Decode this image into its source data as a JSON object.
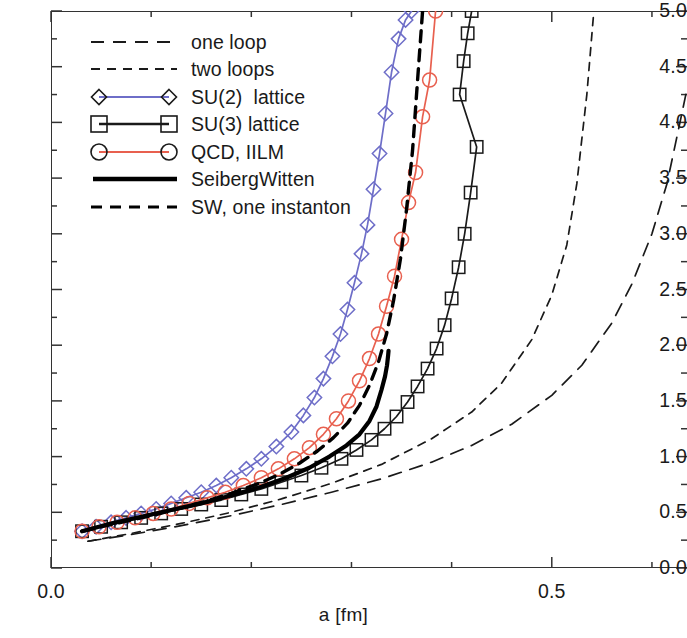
{
  "chart_data": {
    "type": "line",
    "title": "",
    "xlabel": "a [fm]",
    "ylabel": "",
    "xlim": [
      0.0,
      0.635
    ],
    "ylim": [
      0.0,
      5.0
    ],
    "grid": false,
    "legend_position": "upper-left",
    "y_ticks": [
      "0.0",
      "0.5",
      "1.0",
      "1.5",
      "2.0",
      "2.5",
      "3.0",
      "3.5",
      "4.0",
      "4.5",
      "5.0"
    ],
    "y_tick_values": [
      0.0,
      0.5,
      1.0,
      1.5,
      2.0,
      2.5,
      3.0,
      3.5,
      4.0,
      4.5,
      5.0
    ],
    "y_minor_step": 0.25,
    "x_ticks": [
      "0.0",
      "0.5"
    ],
    "x_tick_values": [
      0.0,
      0.5
    ],
    "x_minor_step": 0.1,
    "series": [
      {
        "name": "one loop",
        "style": "long-dash",
        "color": "#1a1a1a",
        "marker": "none",
        "x": [
          0.037,
          0.08,
          0.13,
          0.18,
          0.23,
          0.28,
          0.33,
          0.38,
          0.42,
          0.46,
          0.5,
          0.53,
          0.56,
          0.58,
          0.6,
          0.615,
          0.628,
          0.635
        ],
        "y": [
          0.24,
          0.3,
          0.38,
          0.47,
          0.57,
          0.68,
          0.8,
          0.95,
          1.1,
          1.29,
          1.55,
          1.82,
          2.2,
          2.55,
          3.0,
          3.45,
          4.0,
          4.3
        ]
      },
      {
        "name": "two loops",
        "style": "short-dash",
        "color": "#1a1a1a",
        "marker": "none",
        "x": [
          0.037,
          0.08,
          0.13,
          0.18,
          0.23,
          0.28,
          0.33,
          0.38,
          0.42,
          0.45,
          0.48,
          0.5,
          0.515,
          0.525,
          0.535,
          0.542
        ],
        "y": [
          0.24,
          0.31,
          0.4,
          0.5,
          0.62,
          0.76,
          0.93,
          1.16,
          1.4,
          1.66,
          2.05,
          2.45,
          2.9,
          3.45,
          4.25,
          5.0
        ]
      },
      {
        "name": "SU(2)  lattice",
        "style": "solid",
        "color": "#6e6ec8",
        "marker": "diamond",
        "x": [
          0.031,
          0.045,
          0.06,
          0.075,
          0.09,
          0.105,
          0.12,
          0.135,
          0.15,
          0.165,
          0.18,
          0.195,
          0.21,
          0.225,
          0.24,
          0.252,
          0.263,
          0.272,
          0.281,
          0.289,
          0.296,
          0.303,
          0.31,
          0.316,
          0.322,
          0.328,
          0.334,
          0.34,
          0.347,
          0.354,
          0.36
        ],
        "y": [
          0.33,
          0.37,
          0.41,
          0.45,
          0.49,
          0.53,
          0.58,
          0.63,
          0.68,
          0.74,
          0.81,
          0.89,
          0.98,
          1.09,
          1.22,
          1.37,
          1.53,
          1.7,
          1.9,
          2.1,
          2.32,
          2.56,
          2.82,
          3.08,
          3.4,
          3.72,
          4.08,
          4.45,
          4.75,
          4.92,
          5.0
        ]
      },
      {
        "name": "SU(3) lattice",
        "style": "solid",
        "color": "#1a1a1a",
        "marker": "square",
        "x": [
          0.031,
          0.05,
          0.07,
          0.09,
          0.11,
          0.13,
          0.15,
          0.17,
          0.19,
          0.21,
          0.23,
          0.25,
          0.27,
          0.29,
          0.305,
          0.32,
          0.333,
          0.345,
          0.356,
          0.366,
          0.376,
          0.385,
          0.393,
          0.4,
          0.407,
          0.413,
          0.419,
          0.425,
          0.408,
          0.412,
          0.416,
          0.42
        ],
        "y": [
          0.33,
          0.37,
          0.41,
          0.45,
          0.49,
          0.53,
          0.57,
          0.61,
          0.66,
          0.71,
          0.77,
          0.83,
          0.9,
          0.98,
          1.06,
          1.15,
          1.25,
          1.36,
          1.49,
          1.63,
          1.79,
          1.97,
          2.18,
          2.42,
          2.7,
          3.0,
          3.37,
          3.78,
          4.25,
          4.55,
          4.8,
          5.0
        ]
      },
      {
        "name": "QCD, IILM",
        "style": "solid",
        "color": "#e8604f",
        "marker": "circle",
        "x": [
          0.031,
          0.048,
          0.066,
          0.084,
          0.102,
          0.12,
          0.138,
          0.156,
          0.174,
          0.192,
          0.21,
          0.227,
          0.243,
          0.258,
          0.272,
          0.285,
          0.297,
          0.308,
          0.318,
          0.327,
          0.335,
          0.343,
          0.35,
          0.357,
          0.364,
          0.371,
          0.378,
          0.384
        ],
        "y": [
          0.33,
          0.37,
          0.41,
          0.45,
          0.49,
          0.53,
          0.58,
          0.63,
          0.68,
          0.74,
          0.81,
          0.89,
          0.98,
          1.08,
          1.2,
          1.34,
          1.5,
          1.68,
          1.88,
          2.1,
          2.35,
          2.62,
          2.95,
          3.28,
          3.55,
          4.05,
          4.38,
          5.0
        ]
      },
      {
        "name": "SeibergWitten",
        "style": "solid-thick",
        "color": "#000000",
        "marker": "none",
        "x": [
          0.031,
          0.06,
          0.09,
          0.12,
          0.15,
          0.18,
          0.21,
          0.235,
          0.258,
          0.278,
          0.295,
          0.308,
          0.318,
          0.325,
          0.33,
          0.3335,
          0.3355,
          0.3365,
          0.337
        ],
        "y": [
          0.33,
          0.4,
          0.46,
          0.52,
          0.58,
          0.65,
          0.73,
          0.81,
          0.9,
          1.0,
          1.1,
          1.2,
          1.32,
          1.45,
          1.6,
          1.72,
          1.82,
          1.9,
          1.95
        ]
      },
      {
        "name": "SW, one instanton",
        "style": "short-dash",
        "color": "#000000",
        "marker": "none",
        "x": [
          0.031,
          0.055,
          0.08,
          0.105,
          0.13,
          0.155,
          0.18,
          0.205,
          0.228,
          0.248,
          0.266,
          0.282,
          0.296,
          0.308,
          0.318,
          0.327,
          0.335,
          0.342,
          0.349,
          0.355,
          0.361,
          0.366,
          0.371
        ],
        "y": [
          0.33,
          0.38,
          0.43,
          0.48,
          0.54,
          0.6,
          0.67,
          0.75,
          0.84,
          0.94,
          1.05,
          1.17,
          1.3,
          1.46,
          1.64,
          1.85,
          2.1,
          2.4,
          2.78,
          3.22,
          3.75,
          4.38,
          5.0
        ]
      }
    ]
  },
  "axes": {
    "x_title": "a [fm]",
    "x_tick_labels": [
      "0.0",
      "0.5"
    ],
    "y_tick_labels": [
      "5.0",
      "4.5",
      "4.0",
      "3.5",
      "3.0",
      "2.5",
      "2.0",
      "1.5",
      "1.0",
      "0.5",
      "0.0"
    ]
  },
  "legend": {
    "entries": [
      {
        "label": "one loop",
        "key": "long-dash-key"
      },
      {
        "label": "two loops",
        "key": "short-dash-key"
      },
      {
        "label": "SU(2)  lattice",
        "key": "diamond-line-key"
      },
      {
        "label": "SU(3) lattice",
        "key": "square-line-key"
      },
      {
        "label": "QCD, IILM",
        "key": "circle-line-key"
      },
      {
        "label": "SeibergWitten",
        "key": "thick-solid-key"
      },
      {
        "label": "SW, one instanton",
        "key": "dash-key"
      }
    ]
  },
  "colors": {
    "su2": "#6e6ec8",
    "su3": "#1a1a1a",
    "qcd": "#e8604f",
    "axis": "#333333",
    "text": "#1a1a1a"
  }
}
